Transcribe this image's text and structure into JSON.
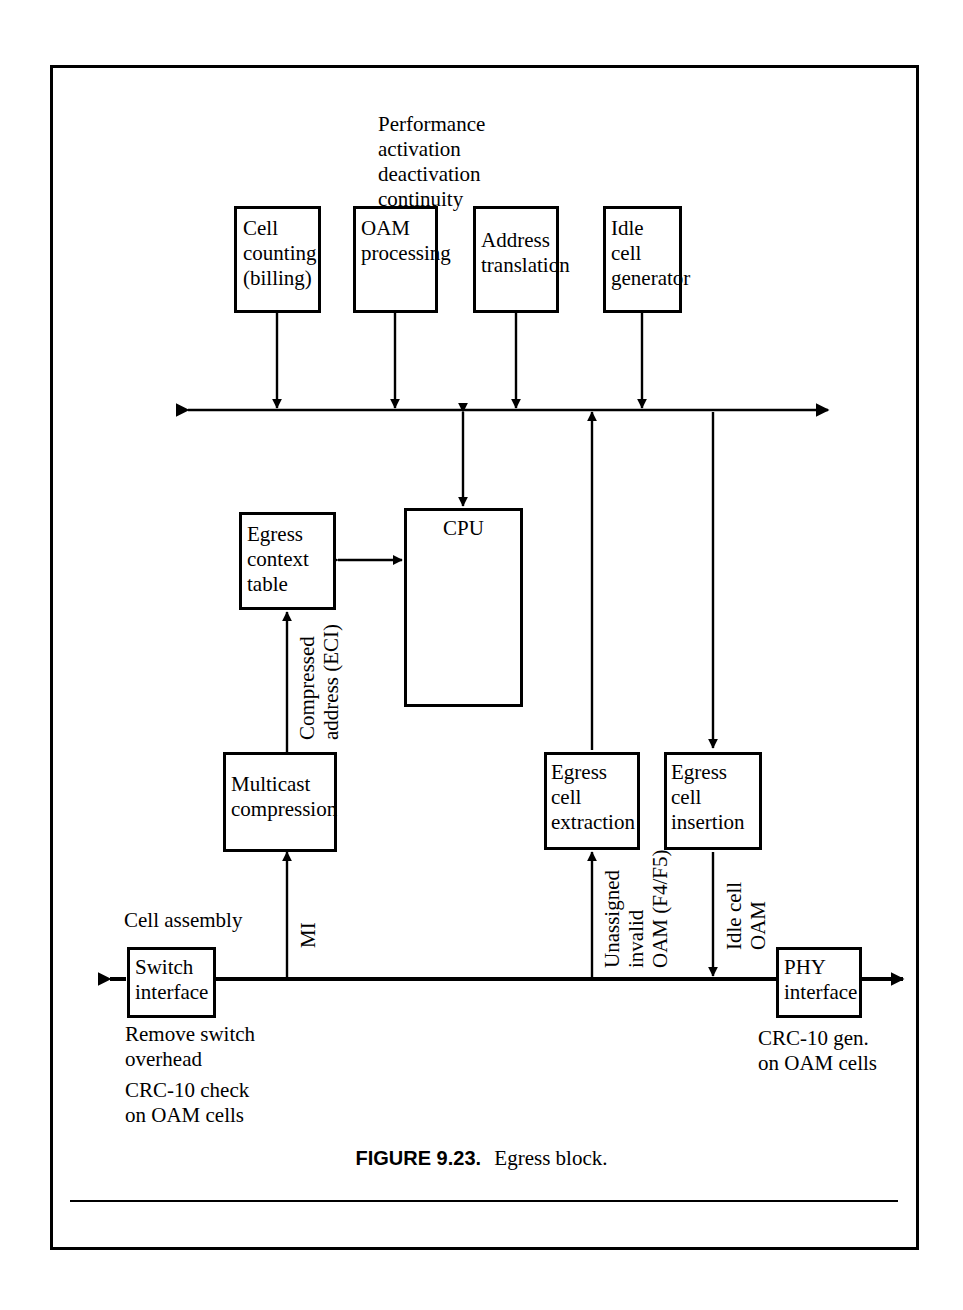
{
  "figure": {
    "number": "FIGURE 9.23.",
    "title": "Egress block.",
    "domain": "ATM switch egress datapath block diagram"
  },
  "boxes": {
    "cell_counting": "Cell\ncounting\n(billing)",
    "oam_processing": "OAM\nprocessing",
    "address_translation": "Address\ntranslation",
    "idle_cell_generator": "Idle\ncell\ngenerator",
    "egress_context_table": "Egress\ncontext\ntable",
    "cpu": "CPU",
    "multicast_compression": "Multicast\ncompression",
    "egress_cell_extraction": "Egress\ncell\nextraction",
    "egress_cell_insertion": "Egress\ncell\ninsertion",
    "switch_interface": "Switch\ninterface",
    "phy_interface": "PHY\ninterface"
  },
  "annotations": {
    "performance_list": "Performance\nactivation\ndeactivation\ncontinuity",
    "cell_assembly": "Cell assembly",
    "remove_switch_overhead": "Remove switch\noverhead",
    "crc10_check": "CRC-10 check\non OAM cells",
    "crc10_gen": "CRC-10 gen.\non OAM cells",
    "compressed_address": "Compressed\naddress (ECI)",
    "mi": "MI",
    "unassigned_invalid": "Unassigned\ninvalid\nOAM (F4/F5)",
    "idle_cell_oam": "Idle cell\nOAM"
  },
  "colors": {
    "ink": "#000000",
    "paper": "#ffffff"
  }
}
